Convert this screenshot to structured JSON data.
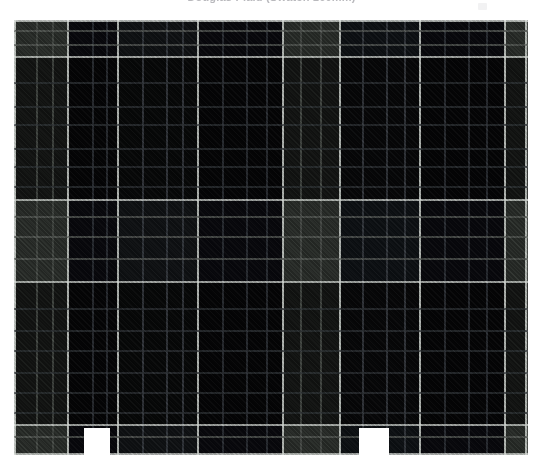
{
  "window": {
    "background": "#ffffff",
    "width": 543,
    "height": 475
  },
  "header": {
    "title": "Douglas Plaid (Swatch 160mm)",
    "title_color": "#b9b9bd",
    "clipped": true,
    "corner_mark": "page-corner-mark"
  },
  "swatch": {
    "name": "tartan-plaid-swatch",
    "x": 14,
    "y": 20,
    "width": 514,
    "height": 435,
    "weave": "2/2-twill",
    "palette": {
      "base_navy": "#0a0a10",
      "dark_slate": "#14171a",
      "olive_grey": "#393d39",
      "mid_grey": "#4a4e4a",
      "pinstripe_white": "#cfd4cf",
      "guide_white": "#d8dcd8",
      "hairline_dark": "#2e3238"
    },
    "warp_bands": [
      {
        "label": "olive-grey",
        "start": 0,
        "end": 54,
        "color": "#393d39"
      },
      {
        "label": "navy",
        "start": 54,
        "end": 104,
        "color": "#0a0a10"
      },
      {
        "label": "slate",
        "start": 104,
        "end": 184,
        "color": "#14171a"
      },
      {
        "label": "navy",
        "start": 184,
        "end": 269,
        "color": "#0a0a10"
      },
      {
        "label": "olive-grey",
        "start": 269,
        "end": 326,
        "color": "#393d39"
      },
      {
        "label": "slate",
        "start": 326,
        "end": 406,
        "color": "#12151a"
      },
      {
        "label": "navy",
        "start": 406,
        "end": 491,
        "color": "#0a0a10"
      },
      {
        "label": "olive-grey",
        "start": 491,
        "end": 514,
        "color": "#393d39"
      }
    ],
    "weft_bands": [
      {
        "label": "light",
        "start": 0,
        "end": 37,
        "color": "#b4b9b4"
      },
      {
        "label": "dark",
        "start": 37,
        "end": 180,
        "color": "#4e524e"
      },
      {
        "label": "light",
        "start": 180,
        "end": 262,
        "color": "#b4b9b4"
      },
      {
        "label": "dark",
        "start": 262,
        "end": 405,
        "color": "#4e524e"
      },
      {
        "label": "light",
        "start": 405,
        "end": 435,
        "color": "#b4b9b4"
      }
    ],
    "guide_lines_x": [
      14,
      68,
      118,
      198,
      283,
      340,
      420,
      505,
      527
    ],
    "guide_lines_y": [
      20,
      57,
      200,
      282,
      425,
      455
    ],
    "selvedge_notches": [
      {
        "name": "notch-left",
        "x": 70,
        "width": 26
      },
      {
        "name": "notch-right",
        "x": 345,
        "width": 30
      }
    ]
  }
}
